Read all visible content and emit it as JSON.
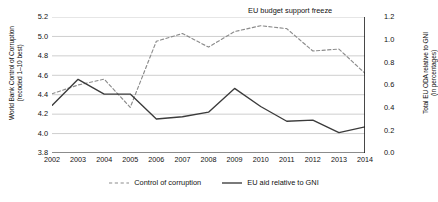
{
  "chart_data": {
    "type": "line",
    "title": "",
    "xlabel": "",
    "categories": [
      "2002",
      "2003",
      "2004",
      "2005",
      "2006",
      "2007",
      "2008",
      "2009",
      "2010",
      "2011",
      "2012",
      "2013",
      "2014"
    ],
    "grid": true,
    "legend_position": "bottom",
    "annotations": [
      {
        "text": "EU budget support freeze",
        "x": "2014",
        "style": "vertical-line-label"
      }
    ],
    "axes": {
      "left": {
        "label_line1": "World Bank Control of Corruption",
        "label_line2": "(recoded 1–10 best)",
        "ylim": [
          3.8,
          5.2
        ],
        "ticks": [
          "5.2",
          "5.0",
          "4.8",
          "4.6",
          "4.4",
          "4.2",
          "4.0",
          "3.8"
        ]
      },
      "right": {
        "label_line1": "Total EU ODA relative to GNI",
        "label_line2": "(in percentages)",
        "ylim": [
          0.0,
          1.2
        ],
        "ticks": [
          "1.2",
          "1.0",
          "0.8",
          "0.6",
          "0.4",
          "0.2",
          "0.0"
        ]
      }
    },
    "series": [
      {
        "name": "Control of corruption",
        "axis": "left",
        "style": "dashed",
        "color": "#8c8c8c",
        "values": [
          4.41,
          4.5,
          4.56,
          4.27,
          4.95,
          5.03,
          4.89,
          5.05,
          5.11,
          5.08,
          4.85,
          4.87,
          4.62
        ]
      },
      {
        "name": "EU aid relative to GNI",
        "axis": "right",
        "style": "solid",
        "color": "#3b3b3b",
        "values": [
          0.42,
          0.65,
          0.52,
          0.52,
          0.3,
          0.32,
          0.36,
          0.57,
          0.41,
          0.28,
          0.29,
          0.18,
          0.23
        ]
      }
    ]
  },
  "legend": {
    "items": [
      {
        "label": "Control of corruption",
        "style": "dashed"
      },
      {
        "label": "EU aid relative to GNI",
        "style": "solid"
      }
    ]
  },
  "colors": {
    "grid": "#b8b8b8",
    "axis": "#1a1a1a",
    "dashed_series": "#8c8c8c",
    "solid_series": "#3b3b3b",
    "background": "#ffffff"
  }
}
